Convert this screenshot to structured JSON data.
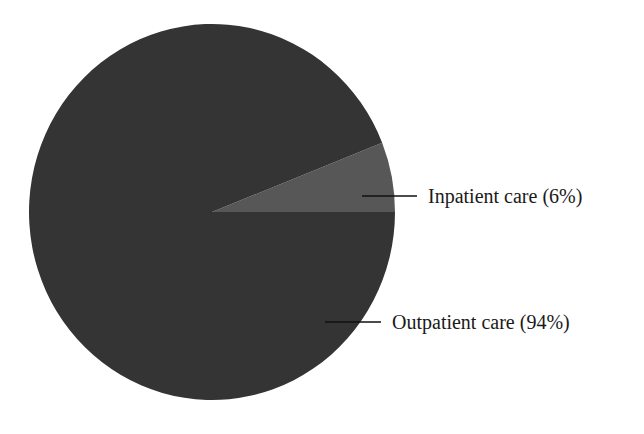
{
  "chart_data": {
    "type": "pie",
    "title": "",
    "categories": [
      "Inpatient care",
      "Outpatient care"
    ],
    "values": [
      6,
      94
    ],
    "unit": "%",
    "labels": [
      "Inpatient care (6%)",
      "Outpatient care (94%)"
    ],
    "colors": [
      "#575757",
      "#343434"
    ],
    "start_angle_deg": 0,
    "direction": "counterclockwise",
    "legend": "none (leader-line labels to the right)"
  },
  "slices": [
    {
      "name": "Inpatient care",
      "value": 6,
      "label": "Inpatient care (6%)",
      "color": "#575757"
    },
    {
      "name": "Outpatient care",
      "value": 94,
      "label": "Outpatient care (94%)",
      "color": "#343434"
    }
  ]
}
